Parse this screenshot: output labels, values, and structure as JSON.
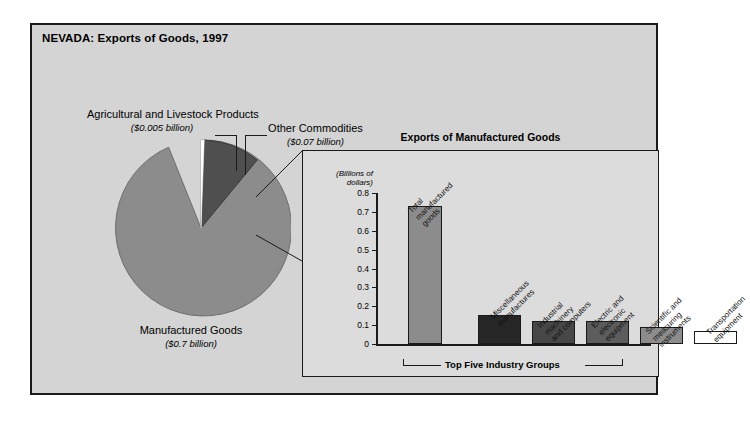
{
  "panel": {
    "title": "NEVADA: Exports of Goods, 1997"
  },
  "pie": {
    "labels": {
      "agricultural": {
        "name": "Agricultural and Livestock Products",
        "amount": "($0.005 billion)"
      },
      "other": {
        "name": "Other Commodities",
        "amount": "($0.07 billion)"
      },
      "manufactured": {
        "name": "Manufactured Goods",
        "amount": "($0.7 billion)"
      }
    }
  },
  "inset": {
    "title": "Exports of Manufactured Goods",
    "axis_unit_line1": "(Billions of",
    "axis_unit_line2": "dollars)",
    "bracket_label": "Top Five Industry Groups"
  },
  "colors": {
    "page_background": "#ffffff",
    "panel_background": "#d4d4d4",
    "inset_background": "#dcdcdc",
    "frame": "#1a1a1a",
    "pie_manufactured": "#8c8c8c",
    "pie_other": "#4f4f4f",
    "pie_agricultural": "#ffffff",
    "bar_total": "#8c8c8c",
    "bar_misc": "#262626",
    "bar_industrial": "#474747",
    "bar_electric": "#5c5c5c",
    "bar_scientific": "#8c8c8c",
    "bar_transportation": "#ffffff"
  },
  "chart_data": [
    {
      "type": "pie",
      "title": "NEVADA: Exports of Goods, 1997",
      "labels": [
        "Manufactured Goods",
        "Other Commodities",
        "Agricultural and Livestock Products"
      ],
      "values": [
        0.7,
        0.07,
        0.005
      ],
      "value_texts": [
        "($0.7 billion)",
        "($0.07 billion)",
        "($0.005 billion)"
      ],
      "unit": "billions of dollars",
      "colors": [
        "#8c8c8c",
        "#4f4f4f",
        "#ffffff"
      ],
      "legend": "labels placed outside with leader lines"
    },
    {
      "type": "bar",
      "title": "Exports of Manufactured Goods",
      "ylabel": "(Billions of dollars)",
      "xlabel": "",
      "ylim": [
        0,
        0.8
      ],
      "yticks": [
        "0",
        "0.1",
        "0.2",
        "0.3",
        "0.4",
        "0.5",
        "0.6",
        "0.7",
        "0.8"
      ],
      "grid": false,
      "categories": [
        "Total manufactured goods",
        "Miscellaneous manufactures",
        "Industrial machinery and computers",
        "Electric and electronic equipment",
        "Scientific and measuring instruments",
        "Transportation equipment"
      ],
      "values": [
        0.73,
        0.155,
        0.12,
        0.12,
        0.09,
        0.07
      ],
      "bar_colors": [
        "#8c8c8c",
        "#262626",
        "#474747",
        "#5c5c5c",
        "#8c8c8c",
        "#ffffff"
      ],
      "annotation": "Top Five Industry Groups",
      "annotation_span": [
        1,
        5
      ]
    }
  ],
  "bars": [
    {
      "label_line1": "Total",
      "label_line2": "manufactured",
      "label_line3": "goods",
      "value": 0.73,
      "color": "#8c8c8c",
      "x": 30,
      "w": 34
    },
    {
      "label_line1": "Miscellaneous",
      "label_line2": "manufactures",
      "label_line3": "",
      "value": 0.155,
      "color": "#262626",
      "x": 100,
      "w": 43
    },
    {
      "label_line1": "Industrial",
      "label_line2": "machinery",
      "label_line3": "and computers",
      "value": 0.12,
      "color": "#474747",
      "x": 154,
      "w": 43
    },
    {
      "label_line1": "Electric and",
      "label_line2": "electronic",
      "label_line3": "equipment",
      "value": 0.12,
      "color": "#5c5c5c",
      "x": 208,
      "w": 43
    },
    {
      "label_line1": "Scientific and",
      "label_line2": "measuring",
      "label_line3": "instruments",
      "value": 0.09,
      "color": "#8c8c8c",
      "x": 262,
      "w": 43
    },
    {
      "label_line1": "Transportation",
      "label_line2": "equipment",
      "label_line3": "",
      "value": 0.07,
      "color": "#ffffff",
      "x": 316,
      "w": 43
    }
  ]
}
